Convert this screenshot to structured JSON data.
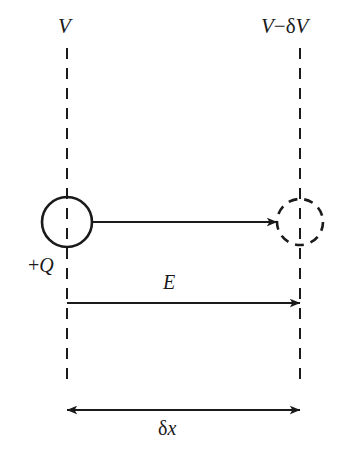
{
  "figure": {
    "background_color": "#ffffff",
    "ink_color": "#1a1a1a",
    "width": 349,
    "height": 459
  },
  "labels": {
    "potential_left": {
      "text": "V",
      "symbol": "V",
      "role": "equipotential-potential"
    },
    "potential_right_v": "V",
    "potential_right_minus": "−",
    "potential_right_delta": "δ",
    "potential_right_v2": "V",
    "potential_right_full": "V − δV",
    "charge": {
      "sign": "+",
      "symbol": "Q",
      "text": "+Q"
    },
    "field": {
      "text": "E",
      "symbol": "E",
      "role": "electric-field"
    },
    "displacement_delta": "δ",
    "displacement_x": "x",
    "displacement_full": "δx"
  },
  "equipotentials": [
    {
      "name": "left-equipotential",
      "label": "V",
      "x": 67,
      "y_top": 48,
      "y_bottom": 385,
      "style": "dashed"
    },
    {
      "name": "right-equipotential",
      "label": "V − δV",
      "x": 300,
      "y_top": 48,
      "y_bottom": 385,
      "style": "dashed"
    }
  ],
  "charges": [
    {
      "name": "charge-initial",
      "label": "+Q",
      "cx": 67,
      "cy": 222,
      "r": 25,
      "style": "solid"
    },
    {
      "name": "charge-final",
      "label": "",
      "cx": 300,
      "cy": 222,
      "r": 23,
      "style": "dashed"
    }
  ],
  "arrows": [
    {
      "name": "displacement-path-arrow",
      "from_x": 92,
      "to_x": 277,
      "y": 222,
      "heads": "end",
      "label": ""
    },
    {
      "name": "field-arrow",
      "from_x": 67,
      "to_x": 300,
      "y": 303,
      "heads": "end",
      "label": "E"
    },
    {
      "name": "separation-arrow",
      "from_x": 67,
      "to_x": 300,
      "y": 410,
      "heads": "both",
      "label": "δx"
    }
  ]
}
